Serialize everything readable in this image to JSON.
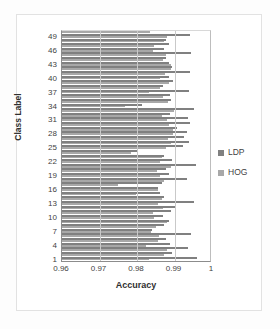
{
  "chart_data": {
    "type": "bar",
    "orientation": "horizontal",
    "title": "",
    "xlabel": "Accuracy",
    "ylabel": "Class Label",
    "xlim": [
      0.96,
      1.0
    ],
    "xticks": [
      "0.96",
      "0.97",
      "0.98",
      "0.99",
      "1"
    ],
    "xtick_values": [
      0.96,
      0.97,
      0.98,
      0.99,
      1.0
    ],
    "ytick_labels": [
      "1",
      "4",
      "7",
      "10",
      "13",
      "16",
      "19",
      "22",
      "25",
      "28",
      "31",
      "34",
      "37",
      "40",
      "43",
      "46",
      "49"
    ],
    "categories": [
      1,
      2,
      3,
      4,
      5,
      6,
      7,
      8,
      9,
      10,
      11,
      12,
      13,
      14,
      15,
      16,
      17,
      18,
      19,
      20,
      21,
      22,
      23,
      24,
      25,
      26,
      27,
      28,
      29,
      30,
      31,
      32,
      33,
      34,
      35,
      36,
      37,
      38,
      39,
      40,
      41,
      42,
      43,
      44,
      45,
      46,
      47,
      48,
      49,
      50
    ],
    "grid": true,
    "grid_axis": "x",
    "legend_position": "right",
    "series": [
      {
        "name": "LDP",
        "color": "#808080",
        "values": [
          0.996,
          0.9894,
          0.9937,
          0.9888,
          0.9876,
          0.9945,
          0.9841,
          0.9873,
          0.9886,
          0.9869,
          0.989,
          0.9904,
          0.9951,
          0.9872,
          0.986,
          0.9856,
          0.9866,
          0.9932,
          0.9884,
          0.9877,
          0.9958,
          0.9894,
          0.9871,
          0.9802,
          0.9922,
          0.9938,
          0.9926,
          0.9933,
          0.9907,
          0.9941,
          0.9936,
          0.9888,
          0.9952,
          0.9812,
          0.9891,
          0.9887,
          0.9938,
          0.9869,
          0.9897,
          0.9884,
          0.9941,
          0.9893,
          0.9884,
          0.9878,
          0.9945,
          0.9872,
          0.9884,
          0.9876,
          0.9941,
          0.9886
        ]
      },
      {
        "name": "HOG",
        "color": "#a8a8a8",
        "values": [
          0.9833,
          0.9872,
          0.9879,
          0.9824,
          0.9855,
          0.9858,
          0.9836,
          0.9851,
          0.988,
          0.9845,
          0.9842,
          0.9869,
          0.9856,
          0.9866,
          0.9796,
          0.9856,
          0.9749,
          0.9871,
          0.9861,
          0.9853,
          0.989,
          0.9862,
          0.9866,
          0.9783,
          0.9878,
          0.9891,
          0.9882,
          0.9897,
          0.9896,
          0.9885,
          0.988,
          0.9866,
          0.9899,
          0.9767,
          0.9883,
          0.987,
          0.9832,
          0.9861,
          0.9886,
          0.9862,
          0.9874,
          0.9891,
          0.989,
          0.9868,
          0.9877,
          0.9843,
          0.9846,
          0.9873,
          0.9879,
          0.9835
        ]
      }
    ]
  },
  "legend": {
    "items": [
      {
        "label": "LDP",
        "marker": "square-marker"
      },
      {
        "label": "HOG",
        "marker": "square-marker"
      }
    ]
  },
  "axes": {
    "x_title": "Accuracy",
    "y_title": "Class Label"
  }
}
